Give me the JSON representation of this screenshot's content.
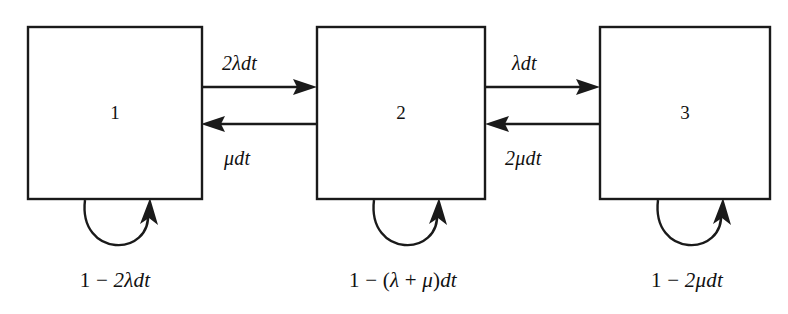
{
  "diagram": {
    "type": "markov-chain-state-transition",
    "background_color": "#ffffff",
    "stroke_color": "#1a1a1a",
    "states": [
      {
        "id": "state-1",
        "label": "1",
        "x": 28,
        "y": 27,
        "width": 174,
        "height": 172
      },
      {
        "id": "state-2",
        "label": "2",
        "x": 317,
        "y": 27,
        "width": 168,
        "height": 172
      },
      {
        "id": "state-3",
        "label": "3",
        "x": 600,
        "y": 27,
        "width": 170,
        "height": 172
      }
    ],
    "transitions": [
      {
        "id": "t-1-to-2",
        "from": "1",
        "to": "2",
        "direction": "right",
        "label": "2λdt",
        "label_parts": [
          {
            "text": "2",
            "style": "italic"
          },
          {
            "text": "λdt",
            "style": "italic"
          }
        ]
      },
      {
        "id": "t-2-to-1",
        "from": "2",
        "to": "1",
        "direction": "left",
        "label": "μdt",
        "label_parts": [
          {
            "text": "μdt",
            "style": "italic"
          }
        ]
      },
      {
        "id": "t-2-to-3",
        "from": "2",
        "to": "3",
        "direction": "right",
        "label": "λdt",
        "label_parts": [
          {
            "text": "λdt",
            "style": "italic"
          }
        ]
      },
      {
        "id": "t-3-to-2",
        "from": "3",
        "to": "2",
        "direction": "left",
        "label": "2μdt",
        "label_parts": [
          {
            "text": "2",
            "style": "italic"
          },
          {
            "text": "μdt",
            "style": "italic"
          }
        ]
      }
    ],
    "self_loops": [
      {
        "id": "loop-1",
        "state": "1",
        "label": "1 − 2λdt",
        "label_parts": [
          {
            "text": "1 ",
            "style": "roman"
          },
          {
            "text": "− ",
            "style": "roman"
          },
          {
            "text": "2λdt",
            "style": "italic"
          }
        ]
      },
      {
        "id": "loop-2",
        "state": "2",
        "label": "1 − (λ + μ)dt",
        "label_parts": [
          {
            "text": "1 ",
            "style": "roman"
          },
          {
            "text": "− (",
            "style": "roman"
          },
          {
            "text": "λ",
            "style": "italic"
          },
          {
            "text": " + ",
            "style": "roman"
          },
          {
            "text": "μ",
            "style": "italic"
          },
          {
            "text": ")",
            "style": "roman"
          },
          {
            "text": "dt",
            "style": "italic"
          }
        ]
      },
      {
        "id": "loop-3",
        "state": "3",
        "label": "1 − 2μdt",
        "label_parts": [
          {
            "text": "1 ",
            "style": "roman"
          },
          {
            "text": "− ",
            "style": "roman"
          },
          {
            "text": "2μdt",
            "style": "italic"
          }
        ]
      }
    ],
    "labels": {
      "state_1": "1",
      "state_2": "2",
      "state_3": "3",
      "edge_1_2": "2λdt",
      "edge_2_1": "μdt",
      "edge_2_3": "λdt",
      "edge_3_2": "2μdt",
      "loop_1_prefix": "1 − ",
      "loop_1_term": "2λdt",
      "loop_2_prefix": "1 − (",
      "loop_2_lambda": "λ",
      "loop_2_plus": " + ",
      "loop_2_mu": "μ",
      "loop_2_close": ")",
      "loop_2_dt": "dt",
      "loop_3_prefix": "1 − ",
      "loop_3_term": "2μdt"
    }
  }
}
